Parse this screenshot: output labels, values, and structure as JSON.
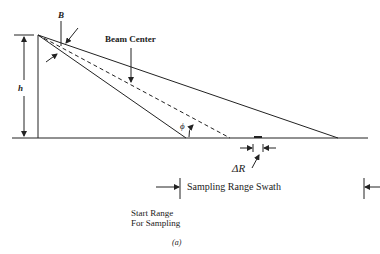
{
  "diagram": {
    "labels": {
      "beam_width": "B",
      "beam_center": "Beam Center",
      "height": "h",
      "angle": "ϕ",
      "range_resolution": "ΔR",
      "swath": "Sampling Range Swath",
      "start_range_line1": "Start Range",
      "start_range_line2": "For Sampling",
      "caption": "(a)"
    },
    "colors": {
      "line": "#222222",
      "background": "#ffffff"
    }
  }
}
